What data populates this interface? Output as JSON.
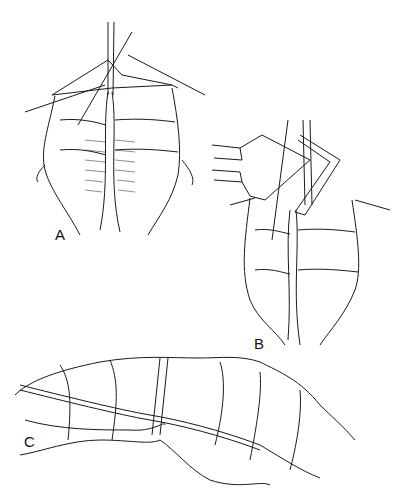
{
  "figure": {
    "panels": [
      {
        "label": "A",
        "description": "Two bowel limbs aligned side by side with stay sutures; incision opened at apex"
      },
      {
        "label": "B",
        "description": "Linear stapler inserted into the two limbs to create anastomosis"
      },
      {
        "label": "C",
        "description": "Completed anastomosis shown as continuous bowel with staple line"
      }
    ],
    "colors": {
      "line": "#1a1a1a",
      "background": "#ffffff"
    }
  }
}
